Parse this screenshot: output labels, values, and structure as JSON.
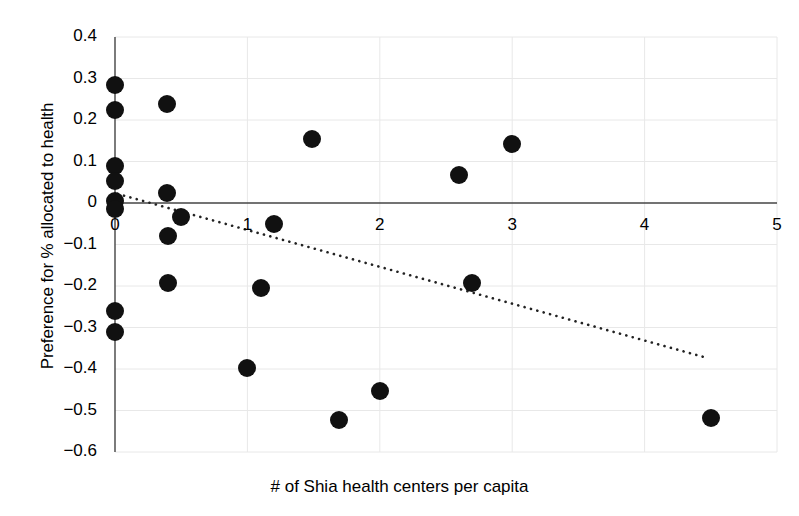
{
  "chart_data": {
    "type": "scatter",
    "title": "",
    "xlabel": "# of Shia health centers per capita",
    "ylabel": "Preference for % allocated to health",
    "xlim": [
      0,
      5
    ],
    "ylim": [
      -0.6,
      0.4
    ],
    "xticks": [
      "0",
      "1",
      "2",
      "3",
      "4",
      "5"
    ],
    "xtick_values": [
      0,
      1,
      2,
      3,
      4,
      5
    ],
    "yticks": [
      "0.4",
      "0.3",
      "0.2",
      "0.1",
      "0",
      "−0.1",
      "−0.2",
      "−0.3",
      "−0.4",
      "−0.5",
      "−0.6"
    ],
    "ytick_values": [
      0.4,
      0.3,
      0.2,
      0.1,
      0,
      -0.1,
      -0.2,
      -0.3,
      -0.4,
      -0.5,
      -0.6
    ],
    "grid": true,
    "legend": "none",
    "marker_color": "#111111",
    "marker_size_px": 18,
    "axis_color": "#444444",
    "grid_color": "#e8e8e8",
    "points": [
      {
        "x": 0.0,
        "y": 0.285
      },
      {
        "x": 0.0,
        "y": 0.225
      },
      {
        "x": 0.39,
        "y": 0.238
      },
      {
        "x": 1.49,
        "y": 0.154
      },
      {
        "x": 3.0,
        "y": 0.142
      },
      {
        "x": 2.6,
        "y": 0.068
      },
      {
        "x": 0.0,
        "y": 0.09
      },
      {
        "x": 0.0,
        "y": 0.052
      },
      {
        "x": 0.0,
        "y": 0.005
      },
      {
        "x": 0.0,
        "y": -0.015
      },
      {
        "x": 0.39,
        "y": 0.023
      },
      {
        "x": 0.5,
        "y": -0.034
      },
      {
        "x": 0.4,
        "y": -0.079
      },
      {
        "x": 1.2,
        "y": -0.05
      },
      {
        "x": 0.4,
        "y": -0.192
      },
      {
        "x": 1.1,
        "y": -0.204
      },
      {
        "x": 2.7,
        "y": -0.192
      },
      {
        "x": 0.0,
        "y": -0.26
      },
      {
        "x": 0.0,
        "y": -0.312
      },
      {
        "x": 1.0,
        "y": -0.397
      },
      {
        "x": 2.0,
        "y": -0.452
      },
      {
        "x": 1.69,
        "y": -0.524
      },
      {
        "x": 4.5,
        "y": -0.518
      }
    ],
    "trendline": {
      "style": "dotted",
      "color": "#222222",
      "x_start": 0.02,
      "y_start": 0.022,
      "x_end": 4.48,
      "y_end": -0.374
    }
  }
}
